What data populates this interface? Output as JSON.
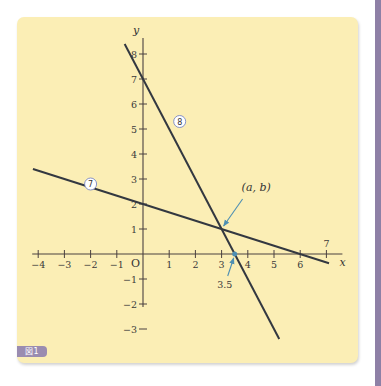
{
  "figure_badge": "図1",
  "colors": {
    "card_background": "#fbeeb5",
    "line": "#333840",
    "axis": "#4a4040",
    "arrow": "#4d8fb3",
    "badge": "#9a8cb0",
    "side_strip": "#8e80a6",
    "label_circle": "#6a78c0"
  },
  "chart_data": {
    "type": "line",
    "title": "",
    "xlabel": "x",
    "ylabel": "y",
    "origin_label": "O",
    "xlim": [
      -4,
      7
    ],
    "ylim": [
      -3,
      8
    ],
    "grid": false,
    "x_ticks": [
      -4,
      -3,
      -2,
      -1,
      1,
      2,
      3,
      4,
      5,
      6,
      7
    ],
    "x_tick_labels": [
      "−4",
      "−3",
      "−2",
      "−1",
      "1",
      "2",
      "3",
      "4",
      "5",
      "6",
      "7"
    ],
    "y_ticks": [
      -3,
      -2,
      -1,
      1,
      2,
      3,
      4,
      5,
      6,
      7,
      8
    ],
    "y_tick_labels": [
      "−3",
      "−2",
      "−1",
      "1",
      "2",
      "3",
      "4",
      "5",
      "6",
      "7",
      "8"
    ],
    "series": [
      {
        "name": "⑦",
        "equation": "y = -x/3 + 2",
        "x": [
          -4.2,
          7.1
        ],
        "y": [
          3.4,
          -0.37
        ],
        "label_at": [
          -2,
          2.8
        ]
      },
      {
        "name": "⑧",
        "equation": "y = -2x + 7",
        "x": [
          -0.7,
          5.2
        ],
        "y": [
          8.4,
          -3.4
        ],
        "label_at": [
          1.4,
          5.3
        ]
      }
    ],
    "annotations": [
      {
        "text": "(a, b)",
        "point": [
          3,
          1
        ],
        "note": "intersection of ⑦ and ⑧"
      },
      {
        "text": "3.5",
        "point": [
          3.5,
          0
        ],
        "note": "x-intercept of ⑧"
      }
    ]
  }
}
